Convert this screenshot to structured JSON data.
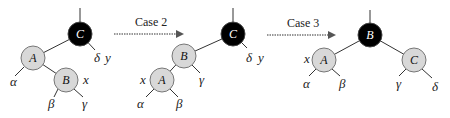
{
  "diagram": {
    "type": "red-black tree rotation cases",
    "colors": {
      "black_node": "#000000",
      "red_node": "#d8d8d8",
      "edge": "#333333",
      "node_border": "#666666"
    },
    "transitions": [
      {
        "label": "Case 2"
      },
      {
        "label": "Case 3"
      }
    ],
    "trees": [
      {
        "nodes": [
          {
            "id": "C",
            "label": "C",
            "color": "black",
            "annotation": "y"
          },
          {
            "id": "A",
            "label": "A",
            "color": "red"
          },
          {
            "id": "B",
            "label": "B",
            "color": "red",
            "annotation": "x"
          }
        ],
        "subtrees": [
          "α",
          "β",
          "γ",
          "δ"
        ]
      },
      {
        "nodes": [
          {
            "id": "C",
            "label": "C",
            "color": "black",
            "annotation": "y"
          },
          {
            "id": "B",
            "label": "B",
            "color": "red"
          },
          {
            "id": "A",
            "label": "A",
            "color": "red",
            "annotation": "x"
          }
        ],
        "subtrees": [
          "α",
          "β",
          "γ",
          "δ"
        ]
      },
      {
        "nodes": [
          {
            "id": "B",
            "label": "B",
            "color": "black"
          },
          {
            "id": "A",
            "label": "A",
            "color": "red",
            "annotation": "x"
          },
          {
            "id": "C",
            "label": "C",
            "color": "red"
          }
        ],
        "subtrees": [
          "α",
          "β",
          "γ",
          "δ"
        ]
      }
    ]
  }
}
